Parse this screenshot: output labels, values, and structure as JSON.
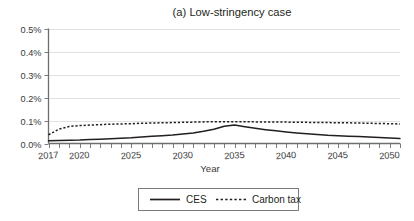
{
  "chart_data": {
    "type": "line",
    "title": "(a) Low-stringency case",
    "xlabel": "Year",
    "ylabel": "",
    "xlim": [
      2017,
      2051
    ],
    "ylim": [
      0.0,
      0.5
    ],
    "grid": true,
    "legend_position": "bottom-center",
    "x_tick_labels": [
      "2017",
      "2020",
      "2025",
      "2030",
      "2035",
      "2040",
      "2045",
      "2050"
    ],
    "x_tick_values": [
      2017,
      2020,
      2025,
      2030,
      2035,
      2040,
      2045,
      2050
    ],
    "y_tick_labels": [
      "0.0%",
      "0.1%",
      "0.2%",
      "0.3%",
      "0.4%",
      "0.5%"
    ],
    "y_tick_values": [
      0.0,
      0.1,
      0.2,
      0.3,
      0.4,
      0.5
    ],
    "x": [
      2017,
      2018,
      2019,
      2020,
      2021,
      2022,
      2023,
      2024,
      2025,
      2026,
      2027,
      2028,
      2029,
      2030,
      2031,
      2032,
      2033,
      2034,
      2035,
      2036,
      2037,
      2038,
      2039,
      2040,
      2041,
      2042,
      2043,
      2044,
      2045,
      2046,
      2047,
      2048,
      2049,
      2050,
      2051
    ],
    "series": [
      {
        "name": "CES",
        "style": "solid",
        "values": [
          0.012,
          0.013,
          0.014,
          0.015,
          0.017,
          0.019,
          0.021,
          0.023,
          0.025,
          0.028,
          0.031,
          0.034,
          0.037,
          0.041,
          0.046,
          0.053,
          0.062,
          0.075,
          0.08,
          0.073,
          0.066,
          0.06,
          0.055,
          0.05,
          0.046,
          0.042,
          0.039,
          0.036,
          0.034,
          0.032,
          0.03,
          0.028,
          0.026,
          0.024,
          0.022
        ]
      },
      {
        "name": "Carbon tax",
        "style": "dotted",
        "values": [
          0.038,
          0.062,
          0.074,
          0.078,
          0.08,
          0.082,
          0.084,
          0.085,
          0.086,
          0.088,
          0.089,
          0.09,
          0.091,
          0.092,
          0.093,
          0.094,
          0.095,
          0.095,
          0.095,
          0.095,
          0.094,
          0.094,
          0.093,
          0.093,
          0.092,
          0.092,
          0.091,
          0.091,
          0.09,
          0.09,
          0.089,
          0.088,
          0.087,
          0.086,
          0.085
        ]
      }
    ]
  },
  "legend": {
    "items": [
      {
        "label": "CES",
        "style": "solid"
      },
      {
        "label": "Carbon tax",
        "style": "dotted"
      }
    ]
  },
  "colors": {
    "series": "#231f20",
    "grid": "#d9d9d9",
    "axis": "#6d6e71",
    "background": "#ffffff"
  }
}
